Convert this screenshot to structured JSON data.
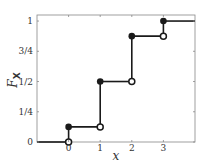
{
  "chart_data": {
    "type": "line",
    "subtype": "step-cdf",
    "title": "",
    "xlabel": "x",
    "ylabel": "F_X",
    "ylabel_main": "F",
    "ylabel_sub": "X",
    "xlim": [
      -1,
      4
    ],
    "ylim": [
      0,
      1.05
    ],
    "xticks": [
      0,
      1,
      2,
      3
    ],
    "xtick_labels": [
      "0",
      "1",
      "2",
      "3"
    ],
    "yticks": [
      0,
      0.25,
      0.5,
      0.75,
      1
    ],
    "ytick_labels": [
      "0",
      "1/4",
      "1/2",
      "3/4",
      "1"
    ],
    "grid": false,
    "legend": null,
    "steps": [
      {
        "x_from": -1,
        "x_to": 0,
        "y": 0
      },
      {
        "x_from": 0,
        "x_to": 1,
        "y": 0.125
      },
      {
        "x_from": 1,
        "x_to": 2,
        "y": 0.5
      },
      {
        "x_from": 2,
        "x_to": 3,
        "y": 0.875
      },
      {
        "x_from": 3,
        "x_to": 4,
        "y": 1
      }
    ],
    "jumps": [
      {
        "x": 0,
        "open_y": 0,
        "closed_y": 0.125
      },
      {
        "x": 1,
        "open_y": 0.125,
        "closed_y": 0.5
      },
      {
        "x": 2,
        "open_y": 0.5,
        "closed_y": 0.875
      },
      {
        "x": 3,
        "open_y": 0.875,
        "closed_y": 1
      }
    ],
    "colors": {
      "line": "#1a1a1a",
      "axes": "#888888"
    }
  }
}
